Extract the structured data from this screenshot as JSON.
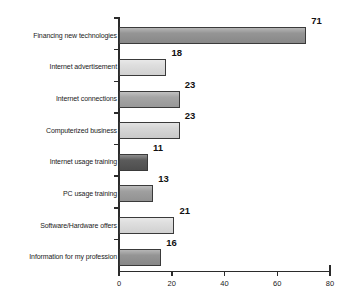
{
  "chart_data": {
    "type": "bar",
    "orientation": "horizontal",
    "title": "",
    "xlabel": "",
    "ylabel": "",
    "xlim": [
      0,
      80
    ],
    "xticks": [
      0,
      20,
      40,
      60,
      80
    ],
    "grid": false,
    "legend": null,
    "categories": [
      "Financing new technologies",
      "Internet advertisement",
      "Internet connections",
      "Computerized business",
      "Internet usage training",
      "PC usage training",
      "Software/Hardware offers",
      "Information for my profession"
    ],
    "values": [
      71,
      18,
      23,
      23,
      11,
      13,
      21,
      16
    ],
    "value_labels": [
      "71",
      "18",
      "23",
      "23",
      "11",
      "13",
      "21",
      "16"
    ],
    "bar_colors": [
      "#8f8f8f",
      "#dcdcdc",
      "#a0a0a0",
      "#d4d4d4",
      "#525252",
      "#9a9a9a",
      "#dcdcdc",
      "#8f8f8f"
    ],
    "bar_border_color": "#3a3a3a"
  },
  "axis": {
    "tick_labels": [
      "0",
      "20",
      "40",
      "60",
      "80"
    ],
    "line_color": "#2b2b2b"
  }
}
